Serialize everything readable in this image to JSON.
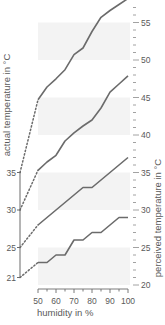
{
  "chart_data": {
    "type": "line",
    "title": "",
    "xlabel": "humidity in %",
    "ylabel_left": "actual temperature in °C",
    "ylabel_right": "perceived temperature in °C",
    "x_ticks": [
      50,
      60,
      70,
      80,
      90,
      100
    ],
    "x_minor_step": 5,
    "xlim": [
      50,
      100
    ],
    "left_ticks": [
      21,
      25,
      30,
      35
    ],
    "right_ticks": [
      20,
      25,
      30,
      35,
      40,
      45,
      50,
      55
    ],
    "right_minor_step": 1,
    "ylim": [
      20,
      58
    ],
    "shaded_bands": [
      [
        20,
        25
      ],
      [
        30,
        35
      ],
      [
        40,
        45
      ],
      [
        50,
        55
      ]
    ],
    "x": [
      50,
      55,
      60,
      65,
      70,
      75,
      80,
      85,
      90,
      95,
      100
    ],
    "series": [
      {
        "name": "35 °C",
        "actual": 35,
        "values": [
          44.7,
          46.4,
          47.5,
          48.7,
          50.7,
          51.6,
          53.8,
          55.7,
          56.6,
          57.4,
          58.2
        ]
      },
      {
        "name": "30 °C",
        "actual": 30,
        "values": [
          35.3,
          36.4,
          37.3,
          39.2,
          40.3,
          41.2,
          42.0,
          43.6,
          45.7,
          46.8,
          47.9
        ]
      },
      {
        "name": "25 °C",
        "actual": 25,
        "values": [
          28.0,
          29.0,
          30.0,
          31.0,
          32.0,
          33.0,
          33.0,
          34.0,
          35.0,
          36.0,
          37.0
        ]
      },
      {
        "name": "21 °C",
        "actual": 21,
        "values": [
          23.0,
          23.0,
          24.0,
          24.0,
          26.0,
          26.0,
          27.0,
          27.0,
          28.0,
          29.0,
          29.0
        ]
      }
    ],
    "grid": false,
    "legend": "none",
    "line_color": "#6b6b6b",
    "band_color": "#f3f3f3"
  }
}
